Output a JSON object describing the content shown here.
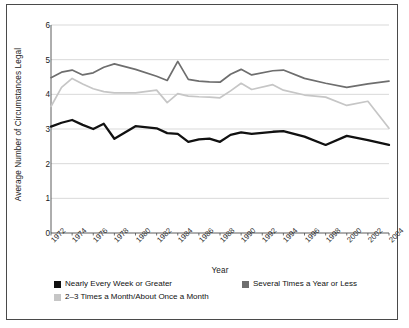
{
  "chart_data": {
    "type": "line",
    "title": "",
    "xlabel": "Year",
    "ylabel": "Average Number of Circumstances Legal",
    "ylim": [
      0,
      6
    ],
    "yticks": [
      0,
      1,
      2,
      3,
      4,
      5,
      6
    ],
    "xlim": [
      1972,
      2004
    ],
    "xticks": [
      1972,
      1974,
      1976,
      1978,
      1980,
      1982,
      1984,
      1986,
      1988,
      1990,
      1992,
      1994,
      1996,
      1998,
      2000,
      2002,
      2004
    ],
    "grid": "horizontal",
    "legend_position": "below-axes",
    "x": [
      1972,
      1973,
      1974,
      1975,
      1976,
      1977,
      1978,
      1980,
      1982,
      1983,
      1984,
      1985,
      1986,
      1987,
      1988,
      1989,
      1990,
      1991,
      1993,
      1994,
      1996,
      1998,
      2000,
      2002,
      2004
    ],
    "series": [
      {
        "name": "Nearly Every Week or Greater",
        "color": "#111111",
        "values": [
          3.07,
          3.18,
          3.26,
          3.12,
          3.0,
          3.15,
          2.72,
          3.08,
          3.02,
          2.88,
          2.86,
          2.63,
          2.7,
          2.72,
          2.63,
          2.83,
          2.9,
          2.86,
          2.92,
          2.94,
          2.78,
          2.54,
          2.8,
          2.68,
          2.54
        ]
      },
      {
        "name": "Several Times a Year or Less",
        "color": "#6e6e6e",
        "values": [
          4.48,
          4.64,
          4.7,
          4.56,
          4.62,
          4.78,
          4.88,
          4.72,
          4.52,
          4.4,
          4.95,
          4.43,
          4.38,
          4.36,
          4.35,
          4.58,
          4.72,
          4.56,
          4.68,
          4.7,
          4.46,
          4.32,
          4.2,
          4.3,
          4.38
        ]
      },
      {
        "name": "2–3 Times a Month/About Once a Month",
        "color": "#c6c6c6",
        "values": [
          3.65,
          4.2,
          4.46,
          4.3,
          4.16,
          4.08,
          4.04,
          4.04,
          4.12,
          3.76,
          4.02,
          3.95,
          3.93,
          3.92,
          3.9,
          4.1,
          4.32,
          4.14,
          4.28,
          4.12,
          3.98,
          3.92,
          3.68,
          3.8,
          3.02
        ]
      }
    ]
  },
  "legend": {
    "entries": [
      {
        "label": "Nearly Every Week or Greater",
        "color": "#111111"
      },
      {
        "label": "Several Times a Year or Less",
        "color": "#6e6e6e"
      },
      {
        "label": "2–3 Times a Month/About Once a Month",
        "color": "#c6c6c6"
      }
    ]
  },
  "axes": {
    "ylabel": "Average Number of Circumstances Legal",
    "xlabel": "Year"
  }
}
